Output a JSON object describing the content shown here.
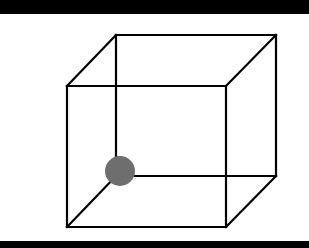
{
  "diagram": {
    "type": "wireframe-cube",
    "line_color": "#000000",
    "background": "#ffffff",
    "band_color": "#000000",
    "front_face": {
      "x1": 67,
      "y1": 86,
      "x2": 226,
      "y2": 227
    },
    "back_face": {
      "x1": 116,
      "y1": 35,
      "x2": 276,
      "y2": 176
    },
    "dot": {
      "cx": 120,
      "cy": 171,
      "r": 15,
      "color": "#6e6e6e"
    }
  }
}
